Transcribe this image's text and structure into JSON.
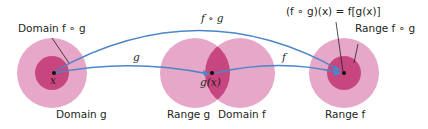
{
  "diagram": {
    "type": "function-composition",
    "colors": {
      "outer_disk": "#e6a7c8",
      "inner_disk": "#c8467f",
      "overlap": "#c8467f",
      "arrow": "#4a86c8",
      "text": "#231f20",
      "leader_line": "#231f20",
      "point": "#111111"
    },
    "labels": {
      "domain_fog": "Domain f ∘ g",
      "domain_g": "Domain g",
      "range_g": "Range g",
      "domain_f": "Domain f",
      "range_f": "Range f",
      "range_fog": "Range f ∘ g",
      "arrow_g": "g",
      "arrow_f": "f",
      "arrow_fog": "f ∘ g",
      "point_x": "x",
      "point_gx": "g(x)",
      "equation": "(f ∘ g)(x) = f[g(x)]"
    }
  }
}
